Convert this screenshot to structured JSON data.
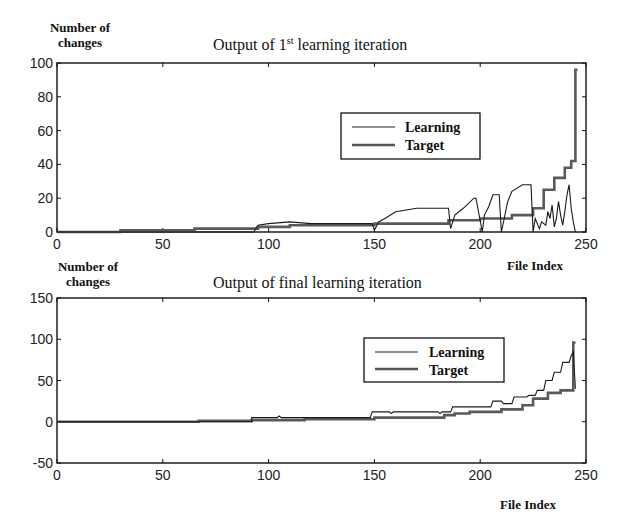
{
  "chart_data": [
    {
      "type": "line",
      "title": "Output of 1st learning iteration",
      "title_main": "Output of 1",
      "title_sup": "st",
      "title_rest": " learning iteration",
      "ylabel_line1": "Number of",
      "ylabel_line2": "changes",
      "xlabel": "File Index",
      "xlim": [
        0,
        250
      ],
      "ylim": [
        0,
        100
      ],
      "xticks": [
        0,
        50,
        100,
        150,
        200,
        250
      ],
      "yticks": [
        0,
        20,
        40,
        60,
        80,
        100
      ],
      "legend": {
        "position": "upper-center-right",
        "entries": [
          "Learning",
          "Target"
        ]
      },
      "series": [
        {
          "name": "Target",
          "style": "thick-gray",
          "x": [
            0,
            30,
            30,
            65,
            65,
            95,
            95,
            110,
            110,
            150,
            150,
            185,
            185,
            200,
            200,
            215,
            215,
            225,
            225,
            230,
            230,
            235,
            235,
            240,
            240,
            243,
            243,
            245,
            245,
            246
          ],
          "y": [
            0,
            0,
            1,
            1,
            2,
            2,
            3,
            3,
            4,
            4,
            5,
            5,
            7,
            7,
            8,
            8,
            10,
            10,
            14,
            14,
            25,
            25,
            32,
            32,
            38,
            38,
            42,
            42,
            96,
            96
          ]
        },
        {
          "name": "Learning",
          "style": "thin-black",
          "x": [
            0,
            93,
            94,
            95,
            100,
            110,
            120,
            149,
            150,
            152,
            155,
            160,
            170,
            185,
            186,
            188,
            192,
            197,
            198,
            201,
            202,
            204,
            206,
            209,
            210,
            213,
            215,
            220,
            224,
            225,
            226,
            228,
            229,
            231,
            232,
            233,
            234,
            235,
            236,
            237,
            238,
            239,
            240,
            241,
            242,
            243,
            244,
            245
          ],
          "y": [
            0,
            0,
            2,
            4,
            5,
            6,
            5,
            5,
            1,
            6,
            8,
            12,
            14,
            14,
            2,
            10,
            14,
            20,
            20,
            0,
            10,
            15,
            22,
            22,
            0,
            18,
            24,
            28,
            28,
            0,
            8,
            2,
            6,
            4,
            12,
            8,
            16,
            3,
            8,
            18,
            10,
            4,
            12,
            22,
            28,
            14,
            6,
            0
          ]
        }
      ]
    },
    {
      "type": "line",
      "title": "Output of final learning iteration",
      "ylabel_line1": "Number of",
      "ylabel_line2": "changes",
      "xlabel": "File Index",
      "xlim": [
        0,
        250
      ],
      "ylim": [
        -50,
        150
      ],
      "xticks": [
        0,
        50,
        100,
        150,
        200,
        250
      ],
      "yticks": [
        -50,
        0,
        50,
        100,
        150
      ],
      "legend": {
        "position": "upper-center-right",
        "entries": [
          "Learning",
          "Target"
        ]
      },
      "series": [
        {
          "name": "Target",
          "style": "thick-gray",
          "x": [
            0,
            67,
            67,
            92,
            92,
            117,
            117,
            150,
            150,
            183,
            183,
            188,
            188,
            195,
            195,
            210,
            210,
            220,
            220,
            225,
            225,
            232,
            232,
            238,
            238,
            244,
            244,
            245
          ],
          "y": [
            0,
            0,
            1,
            1,
            2,
            2,
            3,
            3,
            5,
            5,
            8,
            8,
            10,
            10,
            12,
            12,
            15,
            15,
            20,
            20,
            28,
            28,
            35,
            35,
            38,
            38,
            96,
            96
          ]
        },
        {
          "name": "Learning",
          "style": "thin-black",
          "x": [
            0,
            92,
            92,
            104,
            105,
            106,
            140,
            148,
            149,
            157,
            158,
            159,
            180,
            181,
            182,
            186,
            187,
            205,
            206,
            210,
            211,
            215,
            216,
            222,
            223,
            226,
            227,
            230,
            231,
            234,
            235,
            238,
            239,
            242,
            243,
            244,
            245
          ],
          "y": [
            0,
            0,
            5,
            5,
            7,
            5,
            5,
            5,
            12,
            12,
            10,
            12,
            12,
            10,
            12,
            12,
            18,
            18,
            25,
            25,
            22,
            22,
            30,
            30,
            32,
            32,
            38,
            38,
            50,
            50,
            60,
            60,
            72,
            72,
            80,
            85,
            40
          ]
        }
      ]
    }
  ],
  "charts": [
    {
      "title_a": "Output of 1",
      "title_sup": "st",
      "title_b": " learning iteration",
      "ylabel1": "Number of",
      "ylabel2": "changes",
      "xlabel": "File Index",
      "legend_learning": "Learning",
      "legend_target": "Target"
    },
    {
      "title": "Output of final learning iteration",
      "ylabel1": "Number of",
      "ylabel2": "changes",
      "xlabel": "File Index",
      "legend_learning": "Learning",
      "legend_target": "Target"
    }
  ]
}
